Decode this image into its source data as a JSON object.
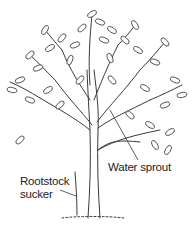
{
  "figure": {
    "labels": {
      "water_sprout": "Water sprout",
      "rootstock_line1": "Rootstock",
      "rootstock_line2": "sucker"
    },
    "colors": {
      "ink": "#333333",
      "background": "#ffffff"
    }
  }
}
